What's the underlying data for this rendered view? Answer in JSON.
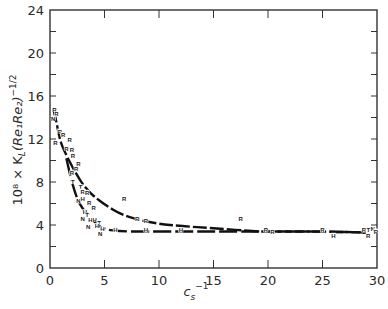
{
  "chart_data": {
    "type": "scatter",
    "title": "",
    "xlabel": "c_s^-1",
    "ylabel": "10^8 × K_L (Re_1 Re_2)^-1/2",
    "xlim": [
      0,
      30
    ],
    "ylim": [
      0,
      24
    ],
    "x_ticks": [
      0,
      5,
      10,
      15,
      20,
      25,
      30
    ],
    "y_ticks": [
      0,
      4,
      8,
      12,
      16,
      20,
      24
    ],
    "grid": false,
    "legend": "none (points labeled with letters R, H, T, N)",
    "series": [
      {
        "name": "upper curve (R points)",
        "line": true,
        "points": [
          [
            0.3,
            14.8
          ],
          [
            0.4,
            14.4
          ],
          [
            0.5,
            14.0
          ],
          [
            0.6,
            13.5
          ],
          [
            0.8,
            12.5
          ],
          [
            1.0,
            11.6
          ],
          [
            1.5,
            10.5
          ],
          [
            2.0,
            9.5
          ],
          [
            2.5,
            8.6
          ],
          [
            3.0,
            7.8
          ],
          [
            3.5,
            7.2
          ],
          [
            4.0,
            6.7
          ],
          [
            5.0,
            5.9
          ],
          [
            6.5,
            5.0
          ],
          [
            8.0,
            4.5
          ],
          [
            10.0,
            4.1
          ],
          [
            12.0,
            3.9
          ],
          [
            15.0,
            3.7
          ],
          [
            19.0,
            3.4
          ],
          [
            20.0,
            3.4
          ],
          [
            25.0,
            3.4
          ],
          [
            29.0,
            3.3
          ]
        ]
      },
      {
        "name": "lower curve (H points)",
        "line": true,
        "points": [
          [
            1.5,
            10.2
          ],
          [
            2.0,
            8.0
          ],
          [
            2.5,
            6.4
          ],
          [
            3.0,
            5.5
          ],
          [
            3.5,
            5.0
          ],
          [
            4.0,
            4.4
          ],
          [
            4.5,
            3.9
          ],
          [
            5.0,
            3.6
          ],
          [
            6.5,
            3.4
          ],
          [
            9.0,
            3.4
          ],
          [
            12.0,
            3.4
          ],
          [
            15.0,
            3.4
          ],
          [
            20.0,
            3.4
          ],
          [
            25.0,
            3.4
          ],
          [
            29.0,
            3.3
          ]
        ]
      },
      {
        "name": "scattered labeled points",
        "line": false,
        "points": [
          {
            "x": 0.4,
            "y": 14.6,
            "label": "R"
          },
          {
            "x": 0.6,
            "y": 14.2,
            "label": "R"
          },
          {
            "x": 0.3,
            "y": 13.8,
            "label": "N"
          },
          {
            "x": 0.9,
            "y": 12.6,
            "label": "R"
          },
          {
            "x": 1.2,
            "y": 12.3,
            "label": "R"
          },
          {
            "x": 0.5,
            "y": 11.5,
            "label": "R"
          },
          {
            "x": 1.8,
            "y": 11.8,
            "label": "R"
          },
          {
            "x": 1.5,
            "y": 11.0,
            "label": "R"
          },
          {
            "x": 2.0,
            "y": 10.9,
            "label": "R"
          },
          {
            "x": 2.1,
            "y": 10.3,
            "label": "R"
          },
          {
            "x": 2.6,
            "y": 9.6,
            "label": "R"
          },
          {
            "x": 2.4,
            "y": 9.1,
            "label": "R"
          },
          {
            "x": 2.0,
            "y": 8.7,
            "label": "R"
          },
          {
            "x": 2.1,
            "y": 7.9,
            "label": "T"
          },
          {
            "x": 2.8,
            "y": 7.4,
            "label": "T"
          },
          {
            "x": 3.0,
            "y": 7.0,
            "label": "R"
          },
          {
            "x": 3.4,
            "y": 6.9,
            "label": "R"
          },
          {
            "x": 2.6,
            "y": 6.1,
            "label": "N"
          },
          {
            "x": 3.0,
            "y": 6.3,
            "label": "H"
          },
          {
            "x": 3.6,
            "y": 6.0,
            "label": "R"
          },
          {
            "x": 4.0,
            "y": 5.5,
            "label": "R"
          },
          {
            "x": 3.2,
            "y": 5.1,
            "label": "H"
          },
          {
            "x": 3.4,
            "y": 4.8,
            "label": "T"
          },
          {
            "x": 3.0,
            "y": 4.5,
            "label": "N"
          },
          {
            "x": 3.7,
            "y": 4.4,
            "label": "H"
          },
          {
            "x": 4.1,
            "y": 4.4,
            "label": "H"
          },
          {
            "x": 4.5,
            "y": 4.1,
            "label": "T"
          },
          {
            "x": 4.3,
            "y": 3.8,
            "label": "H"
          },
          {
            "x": 4.8,
            "y": 3.5,
            "label": "H"
          },
          {
            "x": 3.5,
            "y": 3.7,
            "label": "N"
          },
          {
            "x": 4.6,
            "y": 3.1,
            "label": "N"
          },
          {
            "x": 6.0,
            "y": 3.4,
            "label": "H"
          },
          {
            "x": 6.8,
            "y": 6.3,
            "label": "R"
          },
          {
            "x": 8.0,
            "y": 4.5,
            "label": "R"
          },
          {
            "x": 8.8,
            "y": 4.3,
            "label": "R"
          },
          {
            "x": 8.8,
            "y": 3.4,
            "label": "H"
          },
          {
            "x": 12.0,
            "y": 3.4,
            "label": "H"
          },
          {
            "x": 17.5,
            "y": 4.5,
            "label": "R"
          },
          {
            "x": 19.8,
            "y": 3.4,
            "label": "R"
          },
          {
            "x": 20.4,
            "y": 3.3,
            "label": "R"
          },
          {
            "x": 25.0,
            "y": 3.4,
            "label": "R"
          },
          {
            "x": 26.0,
            "y": 2.9,
            "label": "H"
          },
          {
            "x": 28.8,
            "y": 3.4,
            "label": "R"
          },
          {
            "x": 29.2,
            "y": 3.4,
            "label": "T"
          },
          {
            "x": 29.6,
            "y": 3.5,
            "label": "N"
          },
          {
            "x": 29.9,
            "y": 3.3,
            "label": "R"
          },
          {
            "x": 29.2,
            "y": 2.9,
            "label": "R"
          }
        ]
      }
    ]
  },
  "axes": {
    "x_label_main": "c",
    "x_label_sub": "s",
    "x_label_sup": "−1",
    "y_label_text": "10⁸ × K",
    "y_label_sub": "L",
    "y_label_rest": "(Re₁Re₂)",
    "y_label_sup": "−1/2"
  }
}
